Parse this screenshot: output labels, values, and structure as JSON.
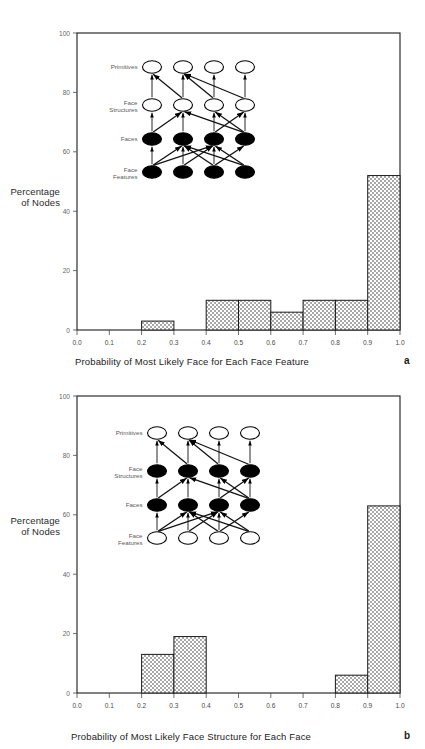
{
  "page": {
    "background": "#ffffff",
    "axis_color": "#1a1a1a",
    "bar_fill_color": "#b9b9b9",
    "bar_edge_color": "#1a1a1a",
    "node_filled_color": "#000000",
    "node_open_color": "#ffffff"
  },
  "panels": [
    {
      "id": "a",
      "letter": "a",
      "ylabel_line1": "Percentage",
      "ylabel_line2": "of Nodes",
      "xlabel": "Probability of Most Likely Face for Each Face Feature",
      "yticks": [
        "100",
        "80",
        "60",
        "40",
        "20",
        "0"
      ],
      "xticks": [
        "0.0",
        "0.1",
        "0.2",
        "0.3",
        "0.4",
        "0.5",
        "0.6",
        "0.7",
        "0.8",
        "0.9",
        "1.0"
      ],
      "network": {
        "rows": [
          {
            "label_line1": "Primitives",
            "label_line2": "",
            "filled": false
          },
          {
            "label_line1": "Face",
            "label_line2": "Structures",
            "filled": false
          },
          {
            "label_line1": "Faces",
            "label_line2": "",
            "filled": true
          },
          {
            "label_line1": "Face",
            "label_line2": "Features",
            "filled": true
          }
        ]
      }
    },
    {
      "id": "b",
      "letter": "b",
      "ylabel_line1": "Percentage",
      "ylabel_line2": "of Nodes",
      "xlabel": "Probability of Most Likely Face Structure for Each Face",
      "yticks": [
        "100",
        "80",
        "60",
        "40",
        "20",
        "0"
      ],
      "xticks": [
        "0.0",
        "0.1",
        "0.2",
        "0.3",
        "0.4",
        "0.5",
        "0.6",
        "0.7",
        "0.8",
        "0.9",
        "1.0"
      ],
      "network": {
        "rows": [
          {
            "label_line1": "Primitives",
            "label_line2": "",
            "filled": false
          },
          {
            "label_line1": "Face",
            "label_line2": "Structures",
            "filled": true
          },
          {
            "label_line1": "Faces",
            "label_line2": "",
            "filled": true
          },
          {
            "label_line1": "Face",
            "label_line2": "Features",
            "filled": false
          }
        ]
      }
    }
  ],
  "chart_data": [
    {
      "type": "bar",
      "panel": "a",
      "title": "",
      "xlabel": "Probability of Most Likely Face for Each Face Feature",
      "ylabel": "Percentage of Nodes",
      "categories": [
        "0.0-0.1",
        "0.1-0.2",
        "0.2-0.3",
        "0.3-0.4",
        "0.4-0.5",
        "0.5-0.6",
        "0.6-0.7",
        "0.7-0.8",
        "0.8-0.9",
        "0.9-1.0"
      ],
      "bin_edges": [
        0.0,
        0.1,
        0.2,
        0.3,
        0.4,
        0.5,
        0.6,
        0.7,
        0.8,
        0.9,
        1.0
      ],
      "values": [
        0,
        0,
        3,
        0,
        10,
        10,
        6,
        10,
        10,
        52
      ],
      "xlim": [
        0.0,
        1.0
      ],
      "ylim": [
        0,
        100
      ],
      "ytick_values": [
        100,
        80,
        60,
        40,
        20,
        0
      ],
      "xtick_values": [
        0.0,
        0.1,
        0.2,
        0.3,
        0.4,
        0.5,
        0.6,
        0.7,
        0.8,
        0.9,
        1.0
      ],
      "grid": false,
      "legend": null
    },
    {
      "type": "bar",
      "panel": "b",
      "title": "",
      "xlabel": "Probability of Most Likely Face Structure for Each Face",
      "ylabel": "Percentage of Nodes",
      "categories": [
        "0.0-0.1",
        "0.1-0.2",
        "0.2-0.3",
        "0.3-0.4",
        "0.4-0.5",
        "0.5-0.6",
        "0.6-0.7",
        "0.7-0.8",
        "0.8-0.9",
        "0.9-1.0"
      ],
      "bin_edges": [
        0.0,
        0.1,
        0.2,
        0.3,
        0.4,
        0.5,
        0.6,
        0.7,
        0.8,
        0.9,
        1.0
      ],
      "values": [
        0,
        0,
        13,
        19,
        0,
        0,
        0,
        0,
        6,
        63
      ],
      "xlim": [
        0.0,
        1.0
      ],
      "ylim": [
        0,
        100
      ],
      "ytick_values": [
        100,
        80,
        60,
        40,
        20,
        0
      ],
      "xtick_values": [
        0.0,
        0.1,
        0.2,
        0.3,
        0.4,
        0.5,
        0.6,
        0.7,
        0.8,
        0.9,
        1.0
      ],
      "grid": false,
      "legend": null
    }
  ]
}
